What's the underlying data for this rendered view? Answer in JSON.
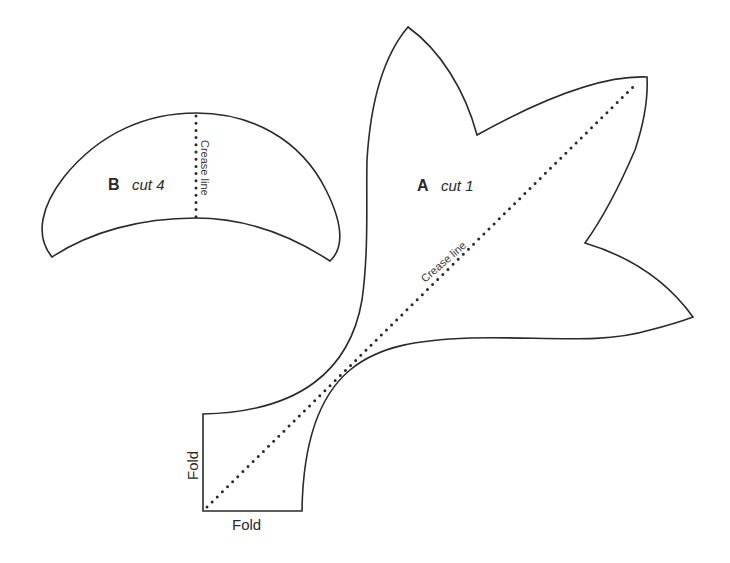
{
  "diagram": {
    "type": "sewing-pattern-template",
    "pieces": [
      {
        "id": "B",
        "letter": "B",
        "instruction": "cut 4",
        "shape": "crescent",
        "crease_label": "Crease line",
        "crease_orientation": "vertical"
      },
      {
        "id": "A",
        "letter": "A",
        "instruction": "cut 1",
        "shape": "three-petal leaf with folded corner",
        "crease_label": "Crease line",
        "crease_orientation": "diagonal",
        "fold_labels": {
          "left": "Fold",
          "bottom": "Fold"
        }
      }
    ],
    "colors": {
      "outline": "#2a2a2a",
      "background": "#ffffff"
    }
  }
}
